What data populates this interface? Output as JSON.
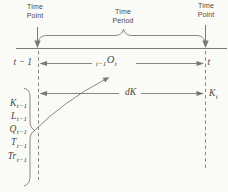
{
  "colors": {
    "background": "#fafaf7",
    "ink": "#4b4944",
    "line": "#7b7975"
  },
  "header": {
    "time_point_left": {
      "line1": "Time",
      "line2": "Point"
    },
    "time_period": {
      "line1": "Time",
      "line2": "Period"
    },
    "time_point_right": {
      "line1": "Time",
      "line2": "Point"
    }
  },
  "interval_row": {
    "left_label": "t − 1",
    "right_label": "t",
    "output_label": {
      "presub": "t−1",
      "main": "O",
      "sub": "t"
    }
  },
  "capital_row": {
    "change_label": "dK",
    "end_label": {
      "main": "K",
      "sub": "t"
    }
  },
  "inputs": [
    {
      "main": "K",
      "sub": "t−1"
    },
    {
      "main": "L",
      "sub": "t−1"
    },
    {
      "main": "Q",
      "sub": "t−1"
    },
    {
      "main": "T",
      "sub": "t−1"
    },
    {
      "main": "Tr",
      "sub": "t−1"
    }
  ]
}
